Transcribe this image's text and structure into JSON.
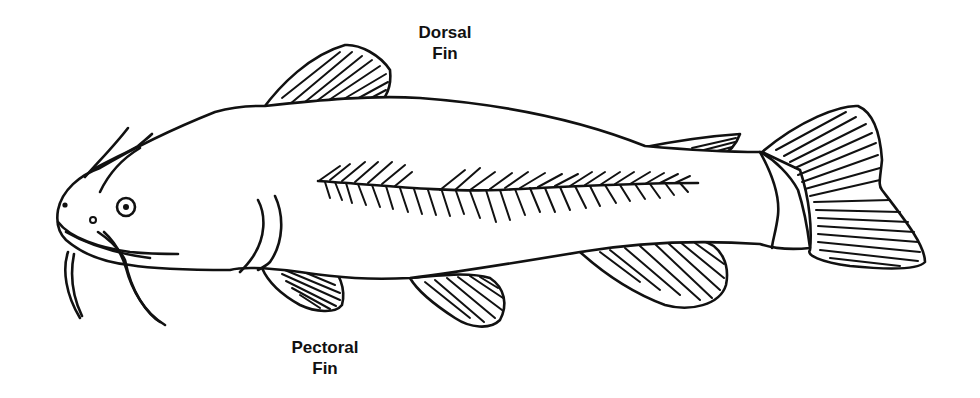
{
  "figure": {
    "labels": [
      {
        "id": "dorsal",
        "lines": [
          "Dorsal",
          "Fin"
        ]
      },
      {
        "id": "pectoral",
        "lines": [
          "Pectoral",
          "Fin"
        ]
      }
    ],
    "parts_drawn": [
      "head",
      "barbels",
      "eye",
      "nostrils",
      "dorsal fin",
      "adipose fin",
      "lateral line",
      "pectoral fin",
      "pelvic fin",
      "anal fin",
      "caudal peduncle",
      "caudal fin"
    ],
    "colors": {
      "ink": "#111111",
      "background": "#ffffff"
    }
  }
}
